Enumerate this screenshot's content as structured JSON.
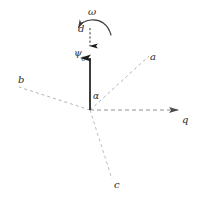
{
  "figure": {
    "background_color": "#ffffff",
    "colors": {
      "solid_vector": "#1a1a1a",
      "dashed_line": "#9a9a9a",
      "label_text": "#2b2b2b",
      "curved_arrow": "#3a3a3a"
    },
    "labels": {
      "omega": "ω",
      "d": "d",
      "psi_symbol": "ψ",
      "psi_subscript": "0",
      "alpha": "α",
      "axis_a": "a",
      "axis_b": "b",
      "axis_c": "c",
      "axis_q": "q"
    },
    "geometry": {
      "origin": {
        "x": 90,
        "y": 110
      },
      "vector_psi": {
        "from_x": 90,
        "from_y": 110,
        "to_x": 90,
        "to_y": 52,
        "style": "solid",
        "arrowhead": "up"
      },
      "vector_d": {
        "from_x": 90,
        "from_y": 30,
        "to_x": 90,
        "to_y": 44,
        "style": "dashed",
        "arrowhead": "down"
      },
      "axis_q": {
        "from_x": 90,
        "from_y": 110,
        "to_x": 180,
        "to_y": 110,
        "style": "dashed",
        "arrowhead": "right"
      },
      "ray_a": {
        "from_x": 90,
        "from_y": 110,
        "to_x": 149,
        "to_y": 56,
        "style": "dashed"
      },
      "ray_b": {
        "from_x": 90,
        "from_y": 110,
        "to_x": 19,
        "to_y": 87,
        "style": "dashed"
      },
      "ray_c": {
        "from_x": 90,
        "from_y": 110,
        "to_x": 112,
        "to_y": 179,
        "style": "dashed"
      },
      "omega_arc": {
        "center_x": 96,
        "center_y": 30,
        "radius": 18,
        "arrowhead": "counterclockwise-left"
      }
    }
  }
}
